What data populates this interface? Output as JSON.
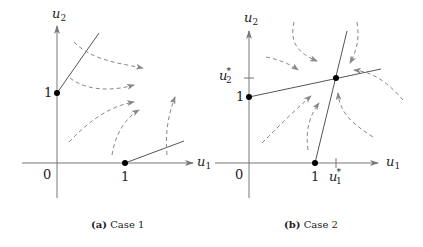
{
  "panels": [
    {
      "id": "a",
      "caption_tag": "(a)",
      "caption_text": "Case 1",
      "axis_x_label": "u",
      "axis_x_sub": "1",
      "axis_y_label": "u",
      "axis_y_sub": "2",
      "origin_label": "0",
      "x_tick_label": "1",
      "y_tick_label": "1"
    },
    {
      "id": "b",
      "caption_tag": "(b)",
      "caption_text": "Case 2",
      "axis_x_label": "u",
      "axis_x_sub": "1",
      "axis_y_label": "u",
      "axis_y_sub": "2",
      "origin_label": "0",
      "x_tick_label": "1",
      "y_tick_label": "1",
      "x_star_label": "u",
      "x_star_sub": "1",
      "y_star_label": "u",
      "y_star_sub": "2",
      "star": "*"
    }
  ],
  "colors": {
    "axis": "#777777",
    "line": "#555555",
    "dashed": "#888888",
    "point": "#000000"
  }
}
